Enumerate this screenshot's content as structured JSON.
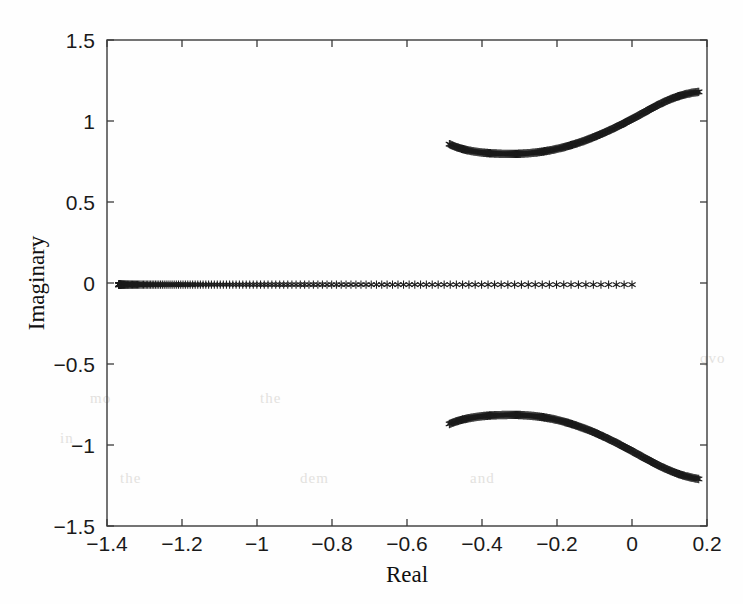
{
  "figure": {
    "background_color": "#fefefe",
    "marker_color": "#1b1b1b",
    "axis_color": "#3a3a3a",
    "marker_symbol": "asterisk-marker"
  },
  "axis_labels": {
    "x": "Real",
    "y": "Imaginary"
  },
  "ghost_text": [
    {
      "text": "qvo",
      "x": 700,
      "y": 350
    },
    {
      "text": "in",
      "x": 60,
      "y": 430
    },
    {
      "text": "the",
      "x": 120,
      "y": 470
    },
    {
      "text": "dem",
      "x": 300,
      "y": 470
    },
    {
      "text": "and",
      "x": 470,
      "y": 470
    },
    {
      "text": "mo",
      "x": 90,
      "y": 390
    },
    {
      "text": "the",
      "x": 260,
      "y": 390
    }
  ],
  "chart_data": {
    "type": "scatter",
    "title": "",
    "xlabel": "Real",
    "ylabel": "Imaginary",
    "xlim": [
      -1.4,
      0.2
    ],
    "ylim": [
      -1.5,
      1.5
    ],
    "xticks": [
      -1.4,
      -1.2,
      -1,
      -0.8,
      -0.6,
      -0.4,
      -0.2,
      0,
      0.2
    ],
    "xticklabels": [
      "-1.4",
      "-1.2",
      "-1",
      "-0.8",
      "-0.6",
      "-0.4",
      "-0.2",
      "0",
      "0.2"
    ],
    "yticks": [
      -1.5,
      -1,
      -0.5,
      0,
      0.5,
      1,
      1.5
    ],
    "yticklabels": [
      "-1.5",
      "-1",
      "-0.5",
      "0",
      "0.5",
      "1",
      "1.5"
    ],
    "grid": false,
    "legend": null,
    "marker": "*",
    "series": [
      {
        "name": "real-axis-branch",
        "comment": "Dense asterisk markers along the real axis, spacing increases to the right",
        "x_start": -1.368,
        "x_end": 0.0,
        "y": -0.01,
        "n_points": 160,
        "spacing": "geometric"
      },
      {
        "name": "upper-complex-branch",
        "comment": "Complex conjugate branch in upper half-plane; dips to a minimum near real=-0.30 then rises",
        "points": [
          [
            -0.487,
            0.857
          ],
          [
            -0.47,
            0.84
          ],
          [
            -0.452,
            0.827
          ],
          [
            -0.434,
            0.817
          ],
          [
            -0.416,
            0.81
          ],
          [
            -0.398,
            0.805
          ],
          [
            -0.38,
            0.801
          ],
          [
            -0.362,
            0.799
          ],
          [
            -0.344,
            0.797
          ],
          [
            -0.326,
            0.797
          ],
          [
            -0.308,
            0.797
          ],
          [
            -0.29,
            0.799
          ],
          [
            -0.272,
            0.802
          ],
          [
            -0.254,
            0.806
          ],
          [
            -0.236,
            0.812
          ],
          [
            -0.218,
            0.819
          ],
          [
            -0.2,
            0.828
          ],
          [
            -0.182,
            0.838
          ],
          [
            -0.164,
            0.85
          ],
          [
            -0.146,
            0.863
          ],
          [
            -0.128,
            0.877
          ],
          [
            -0.11,
            0.893
          ],
          [
            -0.092,
            0.91
          ],
          [
            -0.074,
            0.928
          ],
          [
            -0.056,
            0.947
          ],
          [
            -0.038,
            0.967
          ],
          [
            -0.02,
            0.988
          ],
          [
            -0.002,
            1.01
          ],
          [
            0.016,
            1.032
          ],
          [
            0.034,
            1.055
          ],
          [
            0.052,
            1.078
          ],
          [
            0.07,
            1.1
          ],
          [
            0.088,
            1.12
          ],
          [
            0.106,
            1.138
          ],
          [
            0.124,
            1.153
          ],
          [
            0.142,
            1.165
          ],
          [
            0.16,
            1.174
          ],
          [
            0.178,
            1.18
          ]
        ]
      },
      {
        "name": "lower-complex-branch",
        "comment": "Mirror image of the upper branch about the real axis",
        "points": [
          [
            -0.487,
            -0.87
          ],
          [
            -0.47,
            -0.855
          ],
          [
            -0.452,
            -0.843
          ],
          [
            -0.434,
            -0.834
          ],
          [
            -0.416,
            -0.827
          ],
          [
            -0.398,
            -0.822
          ],
          [
            -0.38,
            -0.818
          ],
          [
            -0.362,
            -0.816
          ],
          [
            -0.344,
            -0.815
          ],
          [
            -0.326,
            -0.814
          ],
          [
            -0.308,
            -0.814
          ],
          [
            -0.29,
            -0.816
          ],
          [
            -0.272,
            -0.819
          ],
          [
            -0.254,
            -0.823
          ],
          [
            -0.236,
            -0.829
          ],
          [
            -0.218,
            -0.836
          ],
          [
            -0.2,
            -0.845
          ],
          [
            -0.182,
            -0.856
          ],
          [
            -0.164,
            -0.868
          ],
          [
            -0.146,
            -0.882
          ],
          [
            -0.128,
            -0.897
          ],
          [
            -0.11,
            -0.913
          ],
          [
            -0.092,
            -0.931
          ],
          [
            -0.074,
            -0.95
          ],
          [
            -0.056,
            -0.97
          ],
          [
            -0.038,
            -0.991
          ],
          [
            -0.02,
            -1.013
          ],
          [
            -0.002,
            -1.035
          ],
          [
            0.016,
            -1.058
          ],
          [
            0.034,
            -1.081
          ],
          [
            0.052,
            -1.103
          ],
          [
            0.07,
            -1.125
          ],
          [
            0.088,
            -1.145
          ],
          [
            0.106,
            -1.163
          ],
          [
            0.124,
            -1.179
          ],
          [
            0.142,
            -1.192
          ],
          [
            0.16,
            -1.202
          ],
          [
            0.178,
            -1.21
          ]
        ]
      }
    ]
  },
  "plot_geometry": {
    "left_px": 107,
    "right_px": 707,
    "top_px": 40,
    "bottom_px": 526
  }
}
